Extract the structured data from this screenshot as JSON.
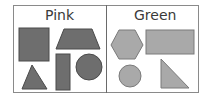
{
  "columns": [
    {
      "label": "Pink",
      "fill": "#6e6e6e",
      "stroke": "#4a4a4a",
      "shapes": [
        "square",
        "trapezoid",
        "triangle",
        "rectangle",
        "circle"
      ]
    },
    {
      "label": "Green",
      "fill": "#a9a9a9",
      "stroke": "#7a7a7a",
      "shapes": [
        "hexagon",
        "rectangle",
        "circle",
        "right-triangle"
      ]
    }
  ],
  "colors": {
    "border": "#8a8a8a",
    "divider": "#6a6a6a",
    "text": "#3a3a3a"
  }
}
